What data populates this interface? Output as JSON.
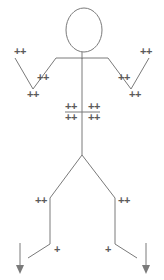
{
  "canvas": {
    "width": 164,
    "height": 280,
    "background": "#ffffff",
    "stroke_color": "#7a7a7a",
    "marker_color": "#5a5a5a",
    "stroke_width": 1
  },
  "diagram": {
    "type": "line-drawing"
  },
  "markers": [
    {
      "name": "marker-left-hand",
      "text": "++",
      "x": 20,
      "y": 51
    },
    {
      "name": "marker-left-forearm",
      "text": "++",
      "x": 43,
      "y": 77
    },
    {
      "name": "marker-left-elbow",
      "text": "++",
      "x": 33,
      "y": 94
    },
    {
      "name": "marker-right-hand",
      "text": "++",
      "x": 146,
      "y": 51
    },
    {
      "name": "marker-right-forearm",
      "text": "++",
      "x": 124,
      "y": 77
    },
    {
      "name": "marker-right-elbow",
      "text": "++",
      "x": 135,
      "y": 94
    },
    {
      "name": "marker-chest-upper-left",
      "text": "++",
      "x": 71,
      "y": 106
    },
    {
      "name": "marker-chest-upper-right",
      "text": "++",
      "x": 94,
      "y": 106
    },
    {
      "name": "marker-chest-lower-left",
      "text": "++",
      "x": 71,
      "y": 117
    },
    {
      "name": "marker-chest-lower-right",
      "text": "++",
      "x": 94,
      "y": 117
    },
    {
      "name": "marker-left-knee",
      "text": "++",
      "x": 41,
      "y": 200
    },
    {
      "name": "marker-right-knee",
      "text": "++",
      "x": 124,
      "y": 200
    },
    {
      "name": "marker-left-ankle",
      "text": "+",
      "x": 57,
      "y": 249
    },
    {
      "name": "marker-right-ankle",
      "text": "+",
      "x": 108,
      "y": 249
    }
  ],
  "geometry": {
    "head": {
      "cx": 84,
      "cy": 30,
      "rx": 18,
      "ry": 22
    },
    "neck": {
      "x1": 82,
      "y1": 52,
      "x2": 82,
      "y2": 59
    },
    "shoulders": {
      "x1": 56,
      "y1": 58,
      "x2": 108,
      "y2": 58
    },
    "spine": {
      "x1": 82,
      "y1": 58,
      "x2": 82,
      "y2": 155
    },
    "left_upper_arm": {
      "x1": 56,
      "y1": 58,
      "x2": 33,
      "y2": 89
    },
    "left_forearm": {
      "x1": 33,
      "y1": 89,
      "x2": 15,
      "y2": 58
    },
    "right_upper_arm": {
      "x1": 108,
      "y1": 58,
      "x2": 131,
      "y2": 89
    },
    "right_forearm": {
      "x1": 131,
      "y1": 89,
      "x2": 149,
      "y2": 58
    },
    "chest_bar": {
      "x1": 65,
      "y1": 112,
      "x2": 100,
      "y2": 112
    },
    "left_thigh": {
      "x1": 82,
      "y1": 155,
      "x2": 50,
      "y2": 198
    },
    "left_shin": {
      "x1": 50,
      "y1": 198,
      "x2": 50,
      "y2": 244
    },
    "left_foot": {
      "x1": 50,
      "y1": 244,
      "x2": 28,
      "y2": 258
    },
    "right_thigh": {
      "x1": 82,
      "y1": 155,
      "x2": 115,
      "y2": 198
    },
    "right_shin": {
      "x1": 115,
      "y1": 198,
      "x2": 115,
      "y2": 244
    },
    "right_foot": {
      "x1": 115,
      "y1": 244,
      "x2": 137,
      "y2": 258
    },
    "left_arrow": {
      "x": 20,
      "y1": 243,
      "y2": 272
    },
    "right_arrow": {
      "x": 146,
      "y1": 243,
      "y2": 272
    }
  }
}
